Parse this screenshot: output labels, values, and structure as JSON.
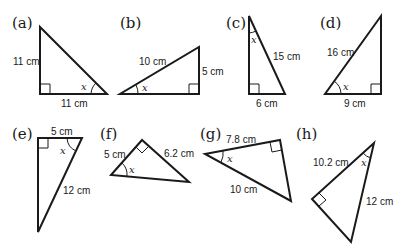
{
  "triangles": [
    {
      "label": "(a)",
      "sides": [
        "11 cm",
        "11 cm"
      ],
      "angle": "x"
    },
    {
      "label": "(b)",
      "sides": [
        "10 cm",
        "5 cm"
      ],
      "angle": "x"
    },
    {
      "label": "(c)",
      "sides": [
        "15 cm",
        "6 cm"
      ],
      "angle": "x"
    },
    {
      "label": "(d)",
      "sides": [
        "16 cm",
        "9 cm"
      ],
      "angle": "x"
    },
    {
      "label": "(e)",
      "sides": [
        "5 cm",
        "12 cm"
      ],
      "angle": "x"
    },
    {
      "label": "(f)",
      "sides": [
        "5 cm",
        "6.2 cm"
      ],
      "angle": "x"
    },
    {
      "label": "(g)",
      "sides": [
        "7.8 cm",
        "10 cm"
      ],
      "angle": "x"
    },
    {
      "label": "(h)",
      "sides": [
        "10.2 cm",
        "12 cm"
      ],
      "angle": "x"
    }
  ]
}
